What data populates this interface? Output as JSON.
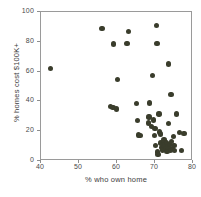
{
  "chart_data": {
    "type": "scatter",
    "title": "",
    "xlabel": "% who own home",
    "ylabel": "% homes cost $100K+",
    "xlim": [
      40,
      80
    ],
    "ylim": [
      0,
      100
    ],
    "xticks": [
      40,
      50,
      60,
      70,
      80
    ],
    "yticks": [
      0,
      20,
      40,
      60,
      80,
      100
    ],
    "grid": false,
    "legend": null,
    "marker": {
      "shape": "circle",
      "color": "#3a3d2c",
      "size_px": 5.4
    },
    "series": [
      {
        "name": "counties",
        "points": [
          [
            42.5,
            62.0
          ],
          [
            56.0,
            89.0
          ],
          [
            58.3,
            36.5
          ],
          [
            58.9,
            36.0
          ],
          [
            59.0,
            78.5
          ],
          [
            59.8,
            34.8
          ],
          [
            60.2,
            54.5
          ],
          [
            62.6,
            79.0
          ],
          [
            63.0,
            87.0
          ],
          [
            65.2,
            38.5
          ],
          [
            65.4,
            27.0
          ],
          [
            65.6,
            17.5
          ],
          [
            66.0,
            17.3
          ],
          [
            68.3,
            25.5
          ],
          [
            68.4,
            29.5
          ],
          [
            68.6,
            39.0
          ],
          [
            69.0,
            23.0
          ],
          [
            69.3,
            57.5
          ],
          [
            69.6,
            27.5
          ],
          [
            69.8,
            17.0
          ],
          [
            70.0,
            22.0
          ],
          [
            70.2,
            10.5
          ],
          [
            70.4,
            91.0
          ],
          [
            70.5,
            79.0
          ],
          [
            70.6,
            6.0
          ],
          [
            70.8,
            4.5
          ],
          [
            71.0,
            31.5
          ],
          [
            71.2,
            19.5
          ],
          [
            71.4,
            18.0
          ],
          [
            71.6,
            12.0
          ],
          [
            71.8,
            9.0
          ],
          [
            72.0,
            7.5
          ],
          [
            72.2,
            11.5
          ],
          [
            72.4,
            14.0
          ],
          [
            72.6,
            10.0
          ],
          [
            72.8,
            8.0
          ],
          [
            73.0,
            12.5
          ],
          [
            73.2,
            6.5
          ],
          [
            73.4,
            9.5
          ],
          [
            73.5,
            65.0
          ],
          [
            73.6,
            25.0
          ],
          [
            73.8,
            11.0
          ],
          [
            74.0,
            7.0
          ],
          [
            74.2,
            44.5
          ],
          [
            74.4,
            13.0
          ],
          [
            74.6,
            8.5
          ],
          [
            74.8,
            16.5
          ],
          [
            75.0,
            10.5
          ],
          [
            75.2,
            7.0
          ],
          [
            75.6,
            31.5
          ],
          [
            76.4,
            19.0
          ],
          [
            77.0,
            7.0
          ],
          [
            77.6,
            18.5
          ]
        ]
      }
    ]
  }
}
